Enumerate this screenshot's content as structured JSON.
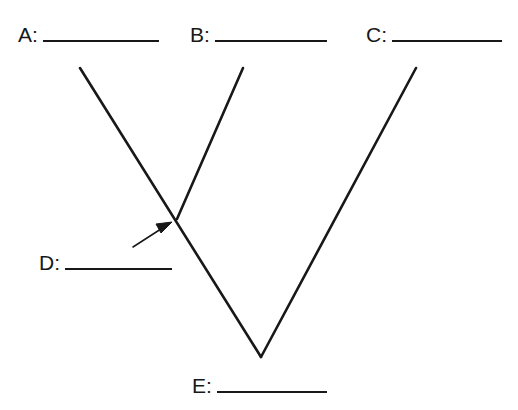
{
  "diagram": {
    "kind": "cladogram",
    "title": "",
    "background_color": "#ffffff",
    "line_color": "#181818",
    "line_width": 2.6,
    "labels": [
      {
        "id": "A",
        "text": "A:",
        "answer": "",
        "x": 18,
        "y": 24,
        "blank_width": 116
      },
      {
        "id": "B",
        "text": "B:",
        "answer": "",
        "x": 190,
        "y": 24,
        "blank_width": 112
      },
      {
        "id": "C",
        "text": "C:",
        "answer": "",
        "x": 366,
        "y": 24,
        "blank_width": 110
      },
      {
        "id": "D",
        "text": "D:",
        "answer": "",
        "x": 39,
        "y": 252,
        "blank_width": 107
      },
      {
        "id": "E",
        "text": "E:",
        "answer": "",
        "x": 192,
        "y": 375,
        "blank_width": 110
      }
    ],
    "branches": [
      {
        "name": "branch-a-tip-to-root",
        "x1": 80,
        "y1": 68,
        "x2": 261,
        "y2": 357
      },
      {
        "name": "branch-c-tip-to-root",
        "x1": 416,
        "y1": 68,
        "x2": 261,
        "y2": 357
      },
      {
        "name": "branch-b-tip-to-node",
        "x1": 243,
        "y1": 68,
        "x2": 177,
        "y2": 219
      }
    ],
    "nodes": [
      {
        "name": "internal-node-d",
        "x": 177,
        "y": 219
      },
      {
        "name": "root-node-e",
        "x": 261,
        "y": 357
      }
    ],
    "pointer": {
      "name": "arrow-to-internal-node",
      "tail_x": 133,
      "tail_y": 247,
      "tip_x": 171,
      "tip_y": 223,
      "head_size": 11
    }
  }
}
